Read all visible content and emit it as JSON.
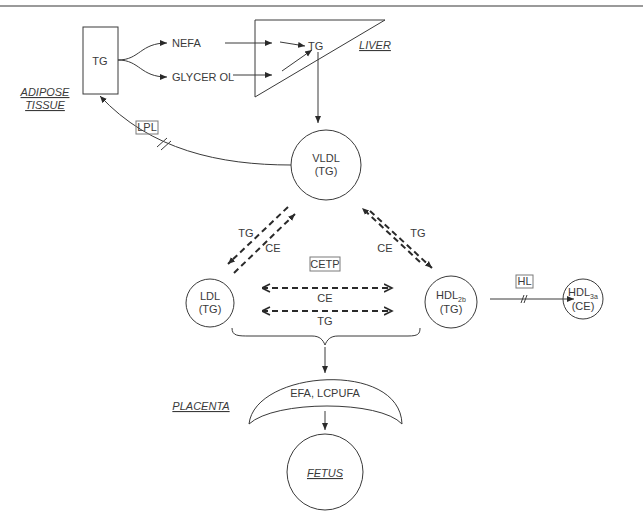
{
  "diagram": {
    "regions": {
      "adipose": [
        "ADIPOSE",
        "TISSUE"
      ],
      "liver": "LIVER",
      "placenta": "PLACENTA",
      "fetus": "FETUS"
    },
    "adipose_box": {
      "label": "TG"
    },
    "products": {
      "nefa": "NEFA",
      "glycerol": "GLYCER OL"
    },
    "liver_tg": "TG",
    "enzymes": {
      "lpl": "LPL",
      "cetp": "CETP",
      "hl": "HL"
    },
    "vldl": {
      "name": "VLDL",
      "content": "(TG)"
    },
    "ldl": {
      "name": "LDL",
      "content": "(TG)"
    },
    "hdl2b": {
      "name": "HDL",
      "sub": "2b",
      "content": "(TG)"
    },
    "hdl3a": {
      "name": "HDL",
      "sub": "3a",
      "content": "(CE)"
    },
    "exchange_left": {
      "tg": "TG",
      "ce": "CE"
    },
    "exchange_right": {
      "tg": "TG",
      "ce": "CE"
    },
    "exchange_mid": {
      "ce": "CE",
      "tg": "TG"
    },
    "placenta_content": "EFA, LCPUFA"
  }
}
